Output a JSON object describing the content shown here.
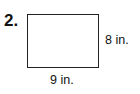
{
  "problem": {
    "number": "2.",
    "shape": "rectangle",
    "height_label": "8 in.",
    "width_label": "9 in."
  }
}
